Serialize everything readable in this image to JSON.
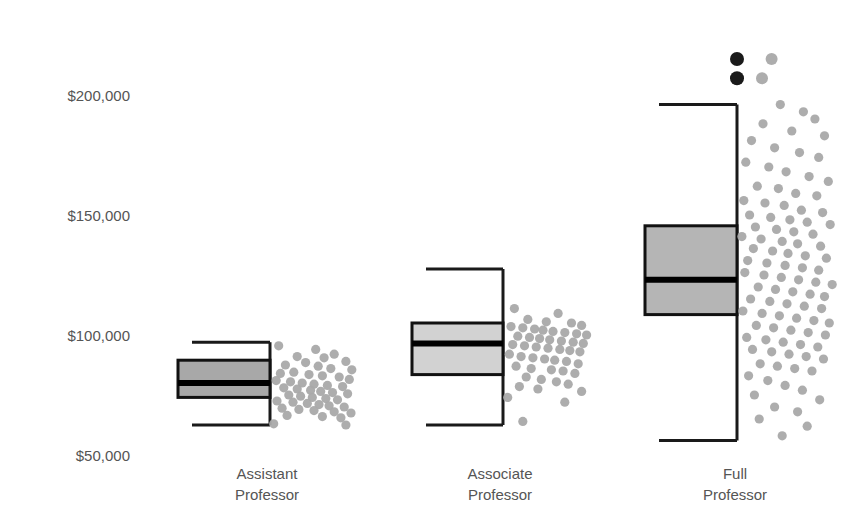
{
  "chart_data": {
    "type": "box",
    "title": "",
    "xlabel": "",
    "ylabel": "",
    "ylim": [
      50000,
      215000
    ],
    "grid": false,
    "legend": "none",
    "y_tick_labels": [
      "$200,000",
      "$150,000",
      "$100,000",
      "$50,000"
    ],
    "y_tick_values": [
      200000,
      150000,
      100000,
      50000
    ],
    "categories": [
      "Assistant Professor",
      "Associate Professor",
      "Full Professor"
    ],
    "category_lines": [
      [
        "Assistant",
        "Professor"
      ],
      [
        "Associate",
        "Professor"
      ],
      [
        "Full",
        "Professor"
      ]
    ],
    "series": [
      {
        "name": "Assistant Professor",
        "box_fill": "#a8a8a8",
        "whisker_low": 62500,
        "q1": 74000,
        "median": 80000,
        "q3": 89500,
        "whisker_high": 97000,
        "outliers": []
      },
      {
        "name": "Associate Professor",
        "box_fill": "#d2d2d2",
        "whisker_low": 62500,
        "q1": 83500,
        "median": 96500,
        "q3": 105000,
        "whisker_high": 127500,
        "outliers": []
      },
      {
        "name": "Full Professor",
        "box_fill": "#b5b5b5",
        "whisker_low": 56000,
        "q1": 108500,
        "median": 123000,
        "q3": 145500,
        "whisker_high": 196000,
        "outliers": [
          207000,
          215000
        ]
      }
    ],
    "jitter_points": {
      "note": "raw observation dots plotted to the right of each box",
      "Assistant Professor": [
        [
          0.08,
          95500
        ],
        [
          0.52,
          94000
        ],
        [
          0.3,
          91000
        ],
        [
          0.62,
          90500
        ],
        [
          0.74,
          92000
        ],
        [
          0.88,
          89000
        ],
        [
          0.16,
          87500
        ],
        [
          0.4,
          88500
        ],
        [
          0.55,
          87000
        ],
        [
          0.7,
          86000
        ],
        [
          0.95,
          85500
        ],
        [
          0.1,
          84000
        ],
        [
          0.26,
          84500
        ],
        [
          0.44,
          83500
        ],
        [
          0.6,
          83000
        ],
        [
          0.8,
          82500
        ],
        [
          0.92,
          81500
        ],
        [
          0.05,
          81000
        ],
        [
          0.22,
          80500
        ],
        [
          0.36,
          80000
        ],
        [
          0.5,
          79500
        ],
        [
          0.66,
          79000
        ],
        [
          0.84,
          78500
        ],
        [
          0.14,
          78000
        ],
        [
          0.3,
          77500
        ],
        [
          0.46,
          77000
        ],
        [
          0.58,
          76500
        ],
        [
          0.72,
          76000
        ],
        [
          0.9,
          75500
        ],
        [
          0.2,
          75000
        ],
        [
          0.34,
          74500
        ],
        [
          0.48,
          74000
        ],
        [
          0.64,
          73500
        ],
        [
          0.78,
          73000
        ],
        [
          0.06,
          72500
        ],
        [
          0.25,
          72000
        ],
        [
          0.42,
          71500
        ],
        [
          0.56,
          71000
        ],
        [
          0.68,
          70500
        ],
        [
          0.86,
          70000
        ],
        [
          0.12,
          69500
        ],
        [
          0.32,
          69000
        ],
        [
          0.5,
          68500
        ],
        [
          0.74,
          68000
        ],
        [
          0.94,
          67500
        ],
        [
          0.18,
          66500
        ],
        [
          0.6,
          66000
        ],
        [
          0.82,
          65500
        ],
        [
          0.02,
          63000
        ],
        [
          0.88,
          62500
        ]
      ],
      "Associate Professor": [
        [
          0.1,
          111000
        ],
        [
          0.62,
          109000
        ],
        [
          0.26,
          106500
        ],
        [
          0.48,
          105500
        ],
        [
          0.78,
          105000
        ],
        [
          0.9,
          104000
        ],
        [
          0.06,
          103500
        ],
        [
          0.2,
          103000
        ],
        [
          0.34,
          102500
        ],
        [
          0.44,
          102000
        ],
        [
          0.56,
          101500
        ],
        [
          0.7,
          101000
        ],
        [
          0.84,
          100500
        ],
        [
          0.96,
          100000
        ],
        [
          0.14,
          99500
        ],
        [
          0.28,
          99000
        ],
        [
          0.4,
          98500
        ],
        [
          0.52,
          98000
        ],
        [
          0.66,
          97500
        ],
        [
          0.8,
          97000
        ],
        [
          0.92,
          96500
        ],
        [
          0.08,
          96000
        ],
        [
          0.22,
          95500
        ],
        [
          0.36,
          95000
        ],
        [
          0.5,
          94500
        ],
        [
          0.64,
          94000
        ],
        [
          0.76,
          93500
        ],
        [
          0.88,
          93000
        ],
        [
          0.04,
          92000
        ],
        [
          0.18,
          91000
        ],
        [
          0.32,
          90500
        ],
        [
          0.46,
          90000
        ],
        [
          0.58,
          89500
        ],
        [
          0.72,
          89000
        ],
        [
          0.86,
          88000
        ],
        [
          0.12,
          87000
        ],
        [
          0.3,
          86000
        ],
        [
          0.54,
          85500
        ],
        [
          0.68,
          85000
        ],
        [
          0.82,
          84000
        ],
        [
          0.24,
          82500
        ],
        [
          0.42,
          81500
        ],
        [
          0.6,
          80500
        ],
        [
          0.74,
          79500
        ],
        [
          0.16,
          78500
        ],
        [
          0.38,
          77500
        ],
        [
          0.9,
          76500
        ],
        [
          0.02,
          74000
        ],
        [
          0.7,
          72000
        ],
        [
          0.2,
          64000
        ]
      ],
      "Full Professor": [
        [
          0.42,
          196000
        ],
        [
          0.66,
          193000
        ],
        [
          0.78,
          190000
        ],
        [
          0.24,
          188000
        ],
        [
          0.54,
          185000
        ],
        [
          0.88,
          183000
        ],
        [
          0.12,
          181000
        ],
        [
          0.36,
          178000
        ],
        [
          0.62,
          176000
        ],
        [
          0.82,
          174000
        ],
        [
          0.06,
          172000
        ],
        [
          0.3,
          170000
        ],
        [
          0.48,
          168000
        ],
        [
          0.72,
          166000
        ],
        [
          0.92,
          164000
        ],
        [
          0.18,
          162000
        ],
        [
          0.4,
          161000
        ],
        [
          0.58,
          159000
        ],
        [
          0.8,
          158000
        ],
        [
          0.04,
          156000
        ],
        [
          0.26,
          155000
        ],
        [
          0.46,
          154000
        ],
        [
          0.64,
          152000
        ],
        [
          0.86,
          151000
        ],
        [
          0.1,
          150000
        ],
        [
          0.32,
          149000
        ],
        [
          0.52,
          148000
        ],
        [
          0.7,
          147000
        ],
        [
          0.94,
          146000
        ],
        [
          0.16,
          145000
        ],
        [
          0.38,
          144000
        ],
        [
          0.56,
          143000
        ],
        [
          0.76,
          142000
        ],
        [
          0.02,
          141000
        ],
        [
          0.22,
          140000
        ],
        [
          0.44,
          139000
        ],
        [
          0.6,
          138000
        ],
        [
          0.84,
          137000
        ],
        [
          0.14,
          136000
        ],
        [
          0.34,
          135000
        ],
        [
          0.5,
          134000
        ],
        [
          0.68,
          133000
        ],
        [
          0.9,
          132000
        ],
        [
          0.08,
          131000
        ],
        [
          0.28,
          130000
        ],
        [
          0.47,
          129000
        ],
        [
          0.65,
          128000
        ],
        [
          0.82,
          127000
        ],
        [
          0.05,
          126000
        ],
        [
          0.25,
          125000
        ],
        [
          0.43,
          124000
        ],
        [
          0.61,
          123000
        ],
        [
          0.79,
          122000
        ],
        [
          0.96,
          121000
        ],
        [
          0.19,
          120000
        ],
        [
          0.37,
          119000
        ],
        [
          0.55,
          118000
        ],
        [
          0.73,
          117000
        ],
        [
          0.88,
          116000
        ],
        [
          0.11,
          115000
        ],
        [
          0.31,
          114000
        ],
        [
          0.49,
          113000
        ],
        [
          0.67,
          112000
        ],
        [
          0.85,
          111000
        ],
        [
          0.03,
          110000
        ],
        [
          0.23,
          109000
        ],
        [
          0.41,
          108000
        ],
        [
          0.59,
          107000
        ],
        [
          0.77,
          106000
        ],
        [
          0.93,
          105000
        ],
        [
          0.17,
          104000
        ],
        [
          0.35,
          103000
        ],
        [
          0.53,
          102000
        ],
        [
          0.71,
          101000
        ],
        [
          0.89,
          100000
        ],
        [
          0.07,
          99000
        ],
        [
          0.27,
          98000
        ],
        [
          0.45,
          97000
        ],
        [
          0.63,
          96000
        ],
        [
          0.81,
          95000
        ],
        [
          0.13,
          94000
        ],
        [
          0.33,
          93000
        ],
        [
          0.51,
          92000
        ],
        [
          0.69,
          91000
        ],
        [
          0.87,
          90000
        ],
        [
          0.21,
          88000
        ],
        [
          0.39,
          87000
        ],
        [
          0.57,
          86000
        ],
        [
          0.75,
          85000
        ],
        [
          0.09,
          83000
        ],
        [
          0.29,
          81000
        ],
        [
          0.47,
          79000
        ],
        [
          0.65,
          77000
        ],
        [
          0.15,
          75000
        ],
        [
          0.83,
          73000
        ],
        [
          0.36,
          70000
        ],
        [
          0.6,
          68000
        ],
        [
          0.2,
          65000
        ],
        [
          0.7,
          62000
        ],
        [
          0.44,
          58000
        ]
      ]
    },
    "top_outlier_dots": [
      [
        0.0,
        215000,
        "dark"
      ],
      [
        0.36,
        215000,
        "light"
      ],
      [
        0.0,
        207000,
        "dark"
      ],
      [
        0.26,
        207000,
        "light"
      ]
    ]
  }
}
